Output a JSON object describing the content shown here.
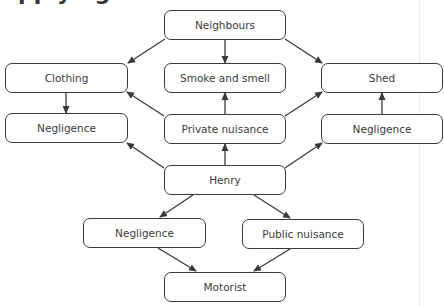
{
  "heading": {
    "text": "Applying"
  },
  "diagram": {
    "stroke_color": "#3a3a3a",
    "nodes": {
      "neighbours": {
        "label": "Neighbours",
        "x": 164,
        "y": 10,
        "w": 122,
        "h": 30
      },
      "clothing": {
        "label": "Clothing",
        "x": 5,
        "y": 63,
        "w": 123,
        "h": 30
      },
      "smoke": {
        "label": "Smoke and smell",
        "x": 164,
        "y": 63,
        "w": 122,
        "h": 30
      },
      "shed": {
        "label": "Shed",
        "x": 321,
        "y": 63,
        "w": 122,
        "h": 30
      },
      "negligence_left": {
        "label": "Negligence",
        "x": 5,
        "y": 113,
        "w": 123,
        "h": 30
      },
      "private_nuisance": {
        "label": "Private nuisance",
        "x": 164,
        "y": 114,
        "w": 122,
        "h": 30
      },
      "negligence_right": {
        "label": "Negligence",
        "x": 321,
        "y": 114,
        "w": 122,
        "h": 30
      },
      "henry": {
        "label": "Henry",
        "x": 164,
        "y": 165,
        "w": 122,
        "h": 30
      },
      "negligence_bottom": {
        "label": "Negligence",
        "x": 83,
        "y": 218,
        "w": 123,
        "h": 30
      },
      "public_nuisance": {
        "label": "Public nuisance",
        "x": 242,
        "y": 219,
        "w": 122,
        "h": 30
      },
      "motorist": {
        "label": "Motorist",
        "x": 164,
        "y": 272,
        "w": 122,
        "h": 30
      }
    },
    "edges": [
      {
        "from": "Neighbours",
        "to": "Clothing",
        "x1": 165,
        "y1": 39,
        "x2": 128,
        "y2": 63
      },
      {
        "from": "Neighbours",
        "to": "Smoke and smell",
        "x1": 225,
        "y1": 40,
        "x2": 225,
        "y2": 63
      },
      {
        "from": "Neighbours",
        "to": "Shed",
        "x1": 285,
        "y1": 39,
        "x2": 322,
        "y2": 63
      },
      {
        "from": "Clothing",
        "to": "Negligence",
        "x1": 66,
        "y1": 93,
        "x2": 66,
        "y2": 113
      },
      {
        "from": "Private nuisance",
        "to": "Smoke and smell",
        "x1": 225,
        "y1": 114,
        "x2": 225,
        "y2": 93
      },
      {
        "from": "Private nuisance",
        "to": "Clothing",
        "x1": 164,
        "y1": 116,
        "x2": 127,
        "y2": 92
      },
      {
        "from": "Private nuisance",
        "to": "Shed",
        "x1": 285,
        "y1": 116,
        "x2": 322,
        "y2": 92
      },
      {
        "from": "Negligence",
        "to": "Shed",
        "x1": 382,
        "y1": 114,
        "x2": 382,
        "y2": 93
      },
      {
        "from": "Henry",
        "to": "Private nuisance",
        "x1": 225,
        "y1": 165,
        "x2": 225,
        "y2": 144
      },
      {
        "from": "Henry",
        "to": "Negligence (left)",
        "x1": 164,
        "y1": 168,
        "x2": 127,
        "y2": 143
      },
      {
        "from": "Henry",
        "to": "Negligence (right)",
        "x1": 285,
        "y1": 168,
        "x2": 322,
        "y2": 143
      },
      {
        "from": "Henry",
        "to": "Negligence (bottom)",
        "x1": 193,
        "y1": 195,
        "x2": 160,
        "y2": 217
      },
      {
        "from": "Henry",
        "to": "Public nuisance",
        "x1": 254,
        "y1": 195,
        "x2": 290,
        "y2": 218
      },
      {
        "from": "Negligence (bottom)",
        "to": "Motorist",
        "x1": 158,
        "y1": 248,
        "x2": 196,
        "y2": 271
      },
      {
        "from": "Public nuisance",
        "to": "Motorist",
        "x1": 290,
        "y1": 249,
        "x2": 254,
        "y2": 271
      }
    ]
  }
}
